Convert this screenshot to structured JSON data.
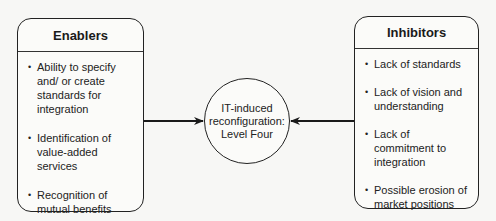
{
  "diagram": {
    "enablers": {
      "title": "Enablers",
      "items": [
        "Ability to specify and/ or create standards for integration",
        "Identification of value-added services",
        "Recognition of mutual benefits"
      ]
    },
    "center": {
      "lines": [
        "IT-induced",
        "reconfiguration:",
        "Level Four"
      ]
    },
    "inhibitors": {
      "title": "Inhibitors",
      "items": [
        "Lack of standards",
        "Lack of vision and understanding",
        "Lack of commitment to integration",
        "Possible erosion of market positions"
      ]
    },
    "connections": [
      {
        "from": "enablers",
        "to": "center"
      },
      {
        "from": "inhibitors",
        "to": "center"
      }
    ]
  }
}
